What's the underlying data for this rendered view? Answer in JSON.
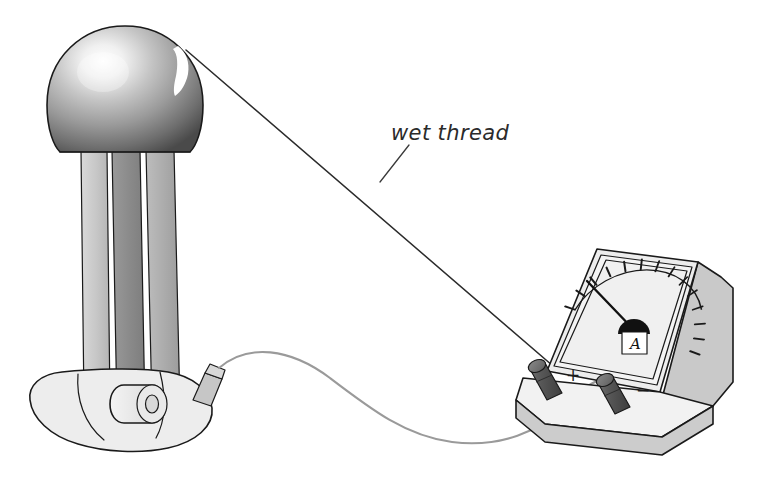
{
  "figure": {
    "background_color": "#ffffff",
    "width": 770,
    "height": 485
  },
  "annotations": {
    "wet_thread_label": "wet thread"
  },
  "generator": {
    "name": "Van de Graaff generator",
    "sphere": {
      "label": "metal dome",
      "highlight": "specular-highlight",
      "fill_light": "#f2f2f2",
      "fill_mid": "#9b9b9b",
      "fill_dark": "#4e4e4e"
    },
    "columns": [
      {
        "label": "left column",
        "fill": "#cfcfcf"
      },
      {
        "label": "centre column",
        "fill": "#8f8f8f"
      },
      {
        "label": "right column",
        "fill": "#b0b0b0"
      }
    ],
    "base": {
      "label": "base",
      "fill": "#ececec"
    },
    "motor_roller": {
      "label": "drive roller",
      "fill": "#e4e4e4"
    },
    "terminal_post": {
      "label": "earth terminal",
      "fill": "#c8c8c8"
    }
  },
  "ammeter": {
    "name": "ammeter",
    "unit_symbol": "A",
    "face_fill": "#f0f0f0",
    "body_fill": "#c9c9c9",
    "bezel_fill": "#e8e8e8",
    "scale": {
      "tick_count": 14,
      "start_angle_deg": 200,
      "end_angle_deg": 340,
      "needle_angle_deg": 216,
      "needle_reading_fraction": 0.11
    },
    "terminals": [
      {
        "label": "+",
        "polarity": "positive",
        "fill": "#5a5a5a"
      },
      {
        "label": "−",
        "polarity": "negative",
        "fill": "#5a5a5a"
      }
    ]
  },
  "connections": {
    "thread": {
      "label": "wet thread",
      "color": "#2b2b2b",
      "from": "generator dome",
      "to": "ammeter positive terminal"
    },
    "lead_wire": {
      "label": "connecting lead",
      "color": "#9a9a9a",
      "from": "generator base terminal",
      "to": "ammeter negative terminal"
    }
  }
}
